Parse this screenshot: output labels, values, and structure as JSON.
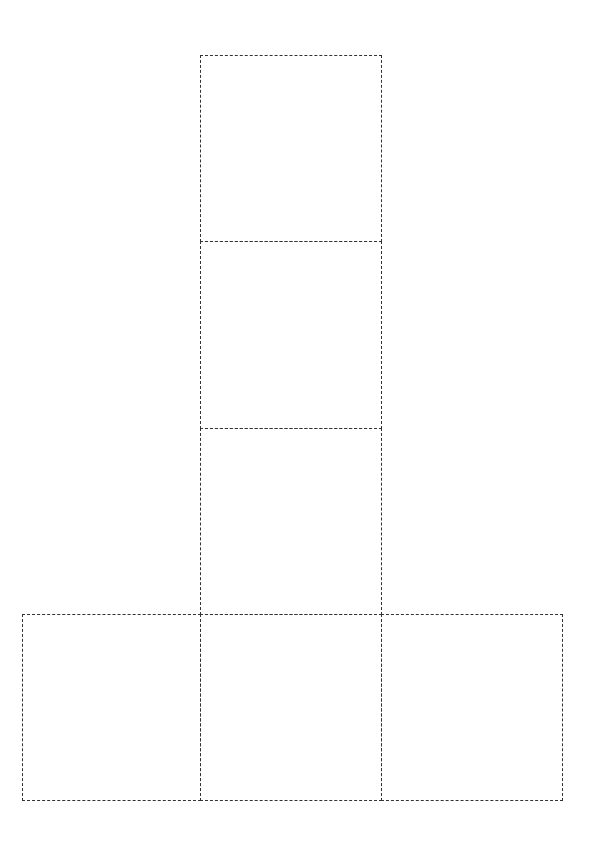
{
  "diagram": {
    "type": "cube-net",
    "line_style": "dashed",
    "line_color": "#333333",
    "faces": [
      {
        "id": "top",
        "x": 200,
        "y": 55,
        "w": 181,
        "h": 186
      },
      {
        "id": "upper-middle",
        "x": 200,
        "y": 241,
        "w": 181,
        "h": 187
      },
      {
        "id": "lower-middle",
        "x": 200,
        "y": 428,
        "w": 181,
        "h": 186
      },
      {
        "id": "bottom-left",
        "x": 22,
        "y": 614,
        "w": 178,
        "h": 186
      },
      {
        "id": "bottom-center",
        "x": 200,
        "y": 614,
        "w": 181,
        "h": 186
      },
      {
        "id": "bottom-right",
        "x": 381,
        "y": 614,
        "w": 181,
        "h": 186
      }
    ]
  }
}
